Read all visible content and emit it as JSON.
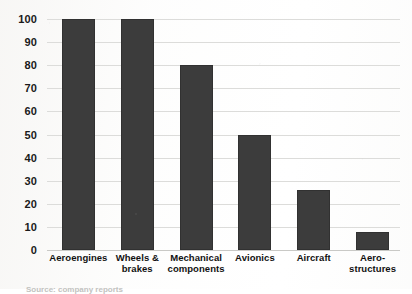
{
  "chart_data": {
    "type": "bar",
    "title": "",
    "subtitle": "",
    "xlabel": "",
    "ylabel": "",
    "categories": [
      "Aeroengines",
      "Wheels & brakes",
      "Mechanical components",
      "Avionics",
      "Aircraft",
      "Aero-structures"
    ],
    "values": [
      100,
      100,
      80,
      50,
      26,
      8
    ],
    "ylim": [
      0,
      100
    ],
    "yticks": [
      0,
      10,
      20,
      30,
      40,
      50,
      60,
      70,
      80,
      90,
      100
    ],
    "ytick_labels": [
      "0",
      "10",
      "20",
      "30",
      "40",
      "50",
      "60",
      "70",
      "80",
      "90",
      "100"
    ],
    "grid": true,
    "legend": false,
    "legend_position": "none",
    "series": [
      {
        "name": "",
        "values": [
          100,
          100,
          80,
          50,
          26,
          8
        ],
        "color": "#3c3c3c"
      }
    ]
  },
  "category_label_lines": [
    [
      "Aeroengines"
    ],
    [
      "Wheels &",
      "brakes"
    ],
    [
      "Mechanical",
      "components"
    ],
    [
      "Avionics"
    ],
    [
      "Aircraft"
    ],
    [
      "Aero-",
      "structures"
    ]
  ],
  "colors": {
    "bar": "#3c3c3c",
    "gridline": "#dcdcda",
    "baseline": "#c9c9c6",
    "text": "#111111",
    "page_background": "#ffffff"
  },
  "bottom_caption": "Source: company reports"
}
